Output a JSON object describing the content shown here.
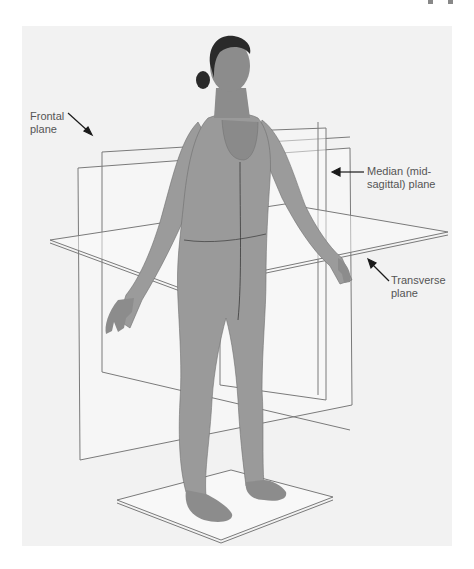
{
  "figure": {
    "labels": {
      "frontal": {
        "line1": "Frontal",
        "line2": "plane"
      },
      "median": {
        "line1": "Median (mid-",
        "line2": "sagittal) plane"
      },
      "transverse": {
        "line1": "Transverse",
        "line2": "plane"
      }
    },
    "colors": {
      "background": "#ffffff",
      "panel": "#f2f2f2",
      "plane_edge": "#7a7a7a",
      "plane_fill": "#fafafa",
      "body": "#9a9a9a",
      "body_shadow": "#6e6e6e",
      "hair": "#2a2a2a",
      "skin": "#8c8c8c",
      "text": "#555555",
      "arrow": "#1a1a1a"
    }
  }
}
